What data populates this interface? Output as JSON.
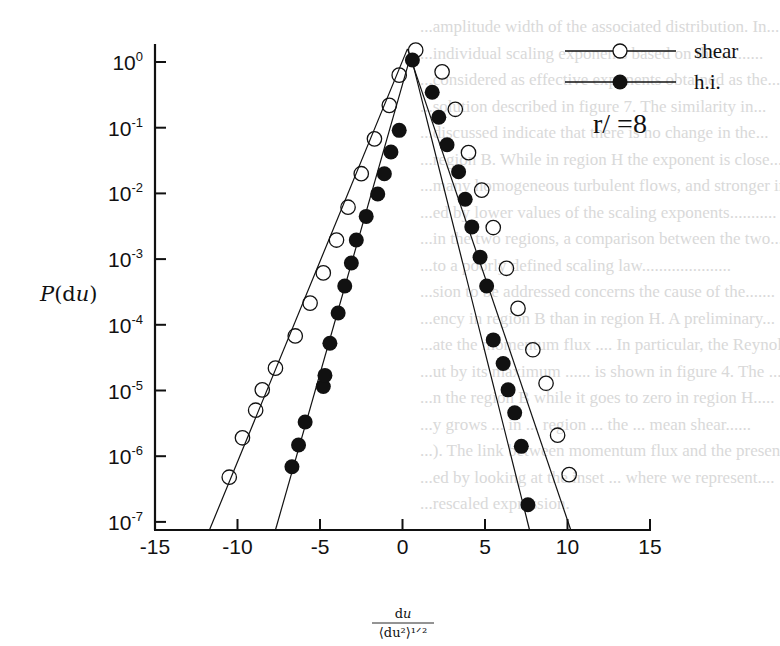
{
  "chart_data": {
    "type": "line",
    "title": "",
    "xlabel": "du / <du^2>^(1/2)",
    "ylabel": "P(du)",
    "xscale": "linear",
    "yscale": "log",
    "xlim": [
      -15,
      15
    ],
    "ylim_log10": [
      -7.3,
      0.1
    ],
    "x_ticks": [
      -15,
      -10,
      -5,
      0,
      5,
      10,
      15
    ],
    "x_tick_labels": [
      "-15",
      "-10",
      "-5",
      "0",
      "5",
      "10",
      "15"
    ],
    "y_ticks_log10": [
      0,
      -1,
      -2,
      -3,
      -4,
      -5,
      -6,
      -7
    ],
    "y_tick_labels": [
      {
        "base": "10",
        "exp": "0"
      },
      {
        "base": "10",
        "exp": "-1"
      },
      {
        "base": "10",
        "exp": "-2"
      },
      {
        "base": "10",
        "exp": "-3"
      },
      {
        "base": "10",
        "exp": "-4"
      },
      {
        "base": "10",
        "exp": "-5"
      },
      {
        "base": "10",
        "exp": "-6"
      },
      {
        "base": "10",
        "exp": "-7"
      }
    ],
    "grid": false,
    "legend_position": "upper right",
    "annotation": "r/  =8",
    "series": [
      {
        "name": "shear",
        "marker": "open-circle",
        "x": [
          -10.5,
          -9.7,
          -8.9,
          -8.5,
          -7.7,
          -6.5,
          -5.6,
          -4.8,
          -4.0,
          -3.3,
          -2.5,
          -1.7,
          -0.8,
          -0.2,
          0.8,
          2.4,
          3.2,
          4.0,
          4.8,
          5.5,
          6.3,
          7.0,
          7.9,
          8.7,
          9.4,
          10.1
        ],
        "log10_y": [
          -6.32,
          -5.72,
          -5.3,
          -4.99,
          -4.66,
          -4.17,
          -3.67,
          -3.21,
          -2.71,
          -2.21,
          -1.7,
          -1.17,
          -0.66,
          -0.2,
          0.18,
          -0.15,
          -0.72,
          -1.38,
          -1.95,
          -2.52,
          -3.14,
          -3.75,
          -4.38,
          -4.89,
          -5.68,
          -6.28
        ]
      },
      {
        "name": "h.i.",
        "marker": "filled-circle",
        "x": [
          -6.7,
          -6.3,
          -5.9,
          -4.8,
          -4.7,
          -4.4,
          -3.9,
          -3.5,
          -3.1,
          -2.8,
          -2.2,
          -1.5,
          -1.1,
          -0.7,
          -0.2,
          0.6,
          1.8,
          2.2,
          2.7,
          3.4,
          3.8,
          4.2,
          4.7,
          5.1,
          5.5,
          6.1,
          6.4,
          6.8,
          7.2,
          7.6
        ],
        "log10_y": [
          -6.16,
          -5.83,
          -5.48,
          -4.94,
          -4.77,
          -4.28,
          -3.82,
          -3.41,
          -3.06,
          -2.71,
          -2.35,
          -2.01,
          -1.7,
          -1.37,
          -1.04,
          0.03,
          -0.46,
          -0.84,
          -1.26,
          -1.67,
          -2.09,
          -2.51,
          -2.97,
          -3.41,
          -4.23,
          -4.59,
          -4.99,
          -5.34,
          -5.85,
          -6.74
        ]
      }
    ],
    "fit_lines": {
      "shear_left": {
        "x": [
          -11.7,
          0.3
        ],
        "log10_y": [
          -7.3,
          0.2
        ]
      },
      "shear_right": {
        "x": [
          0.3,
          10.2
        ],
        "log10_y": [
          0.2,
          -7.3
        ]
      },
      "hi_left": {
        "x": [
          -7.7,
          0.5
        ],
        "log10_y": [
          -7.3,
          0.1
        ]
      },
      "hi_right": {
        "x": [
          0.5,
          7.7
        ],
        "log10_y": [
          0.1,
          -7.3
        ]
      }
    }
  },
  "legend": {
    "items": [
      {
        "label": "shear",
        "marker": "open-circle"
      },
      {
        "label": "h.i.",
        "marker": "filled-circle"
      }
    ],
    "param": "r/  =8"
  },
  "axes": {
    "ylabel_main": "P(du)",
    "xlabel_num": "du",
    "xlabel_den": "⟨du²⟩¹ᐟ²"
  },
  "background_text": [
    "...amplitude width of the associated distribution. In...",
    "...individual scaling exponents based on the ..........",
    "...considered as effective exponents obtained as the...",
    "...solution described in figure 7. The similarity in...",
    "...discussed indicate that there is no change in the...",
    "...region B. While in region H the exponent is close...",
    "...many homogeneous turbulent flows, and stronger int..",
    "...ed by lower values of the scaling exponents...........",
    "...in the two regions, a comparison between the two...",
    "...to a poorly defined scaling law.....................",
    "...sion to be addressed concerns the cause of the.......",
    "...ency in region B than in region H. A preliminary...",
    "...ate the momentum flux .... In particular, the Reynolds",
    "...ut by its maximum ...... is shown in figure 4. The ...",
    "...n the region B while it goes to zero in region H.....",
    "...y grows ... in ... region ... the ... mean shear......",
    "...). The link between momentum flux and the presence...",
    "...ed by looking at the inset ... where we represent....",
    "...rescaled expression."
  ]
}
